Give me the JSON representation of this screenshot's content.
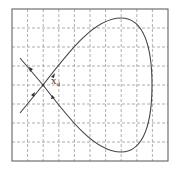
{
  "diagram": {
    "type": "phase-portrait",
    "grid": {
      "columns": 10,
      "rows": 8,
      "style": "dashed"
    },
    "saddle_label": {
      "main": "x",
      "subscript": "d"
    },
    "colors": {
      "frame": "#555555",
      "grid": "#999999",
      "curve": "#444444",
      "background": "#ffffff"
    }
  }
}
